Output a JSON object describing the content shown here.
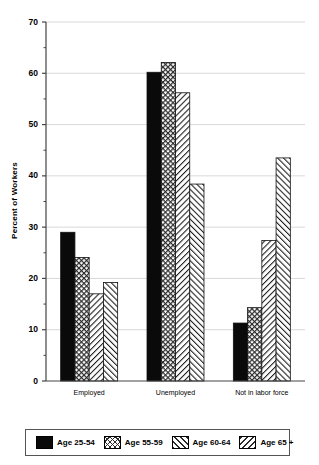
{
  "chart_data": {
    "type": "bar",
    "title": "",
    "subtitle": "",
    "xlabel": "",
    "ylabel": "Percent of Workers",
    "ylim": [
      0,
      70
    ],
    "ytick_labels": [
      "0",
      "10",
      "20",
      "30",
      "40",
      "50",
      "60",
      "70"
    ],
    "ytick_values": [
      0,
      10,
      20,
      30,
      40,
      50,
      60,
      70
    ],
    "yminor_values": [
      5,
      15,
      25,
      35,
      45,
      55,
      65
    ],
    "grid": "horizontal-major",
    "legend_position": "bottom",
    "categories": [
      "Employed",
      "Unemployed",
      "Not in labor force"
    ],
    "series": [
      {
        "name": "Age 25-54",
        "pattern": "solid",
        "values": [
          29.0,
          60.2,
          11.3
        ]
      },
      {
        "name": "Age 55-59",
        "pattern": "check",
        "values": [
          24.1,
          62.1,
          14.3
        ]
      },
      {
        "name": "Age 60-64",
        "pattern": "fslash",
        "values": [
          17.0,
          56.2,
          27.4
        ]
      },
      {
        "name": "Age 65 +",
        "pattern": "bslash",
        "values": [
          19.2,
          38.4,
          43.5
        ]
      }
    ]
  },
  "legend": {
    "items": [
      {
        "label": "Age 25-54",
        "pattern": "solid"
      },
      {
        "label": "Age 55-59",
        "pattern": "check"
      },
      {
        "label": "Age 60-64",
        "pattern": "fslash"
      },
      {
        "label": "Age 65 +",
        "pattern": "bslash"
      }
    ]
  },
  "colors": {
    "axis": "#444444",
    "grid": "#d9d9d9",
    "series_ink": "#1a1a1a",
    "background": "#ffffff"
  }
}
